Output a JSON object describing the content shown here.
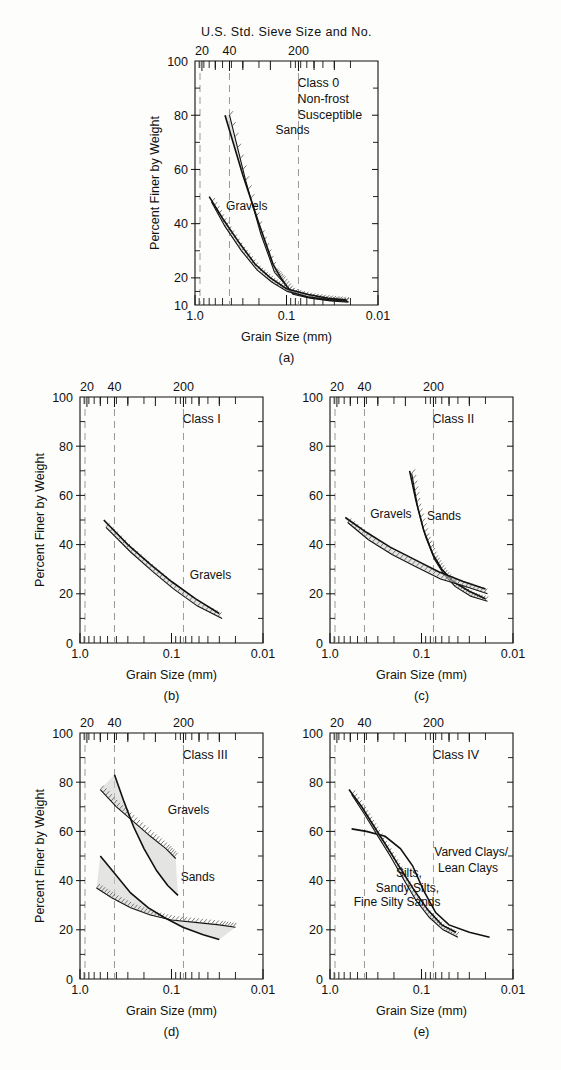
{
  "figure": {
    "sieve_axis_title": "U.S. Std. Sieve Size and No.",
    "sieve_ticks": [
      "20",
      "40",
      "200"
    ],
    "x_axis_label": "Grain Size (mm)",
    "x_ticks": [
      "1.0",
      "0.1",
      "0.01"
    ],
    "y_axis_label": "Percent Finer by Weight"
  },
  "panels": [
    {
      "caption": "(a)",
      "class_label": "Class 0",
      "class_sub_1": "Non-frost",
      "class_sub_2": "Susceptible",
      "y_ticks": [
        "100",
        "80",
        "60",
        "40",
        "20",
        "10"
      ],
      "y_min": 10,
      "y_max": 100,
      "curve_labels": [
        "Sands",
        "Gravels"
      ],
      "show_sieve_title": true,
      "show_ylabel": true
    },
    {
      "caption": "(b)",
      "class_label": "Class I",
      "y_ticks": [
        "100",
        "80",
        "60",
        "40",
        "20",
        "0"
      ],
      "y_min": 0,
      "y_max": 100,
      "curve_labels": [
        "Gravels"
      ],
      "show_sieve_title": false,
      "show_ylabel": true
    },
    {
      "caption": "(c)",
      "class_label": "Class II",
      "y_ticks": [
        "100",
        "80",
        "60",
        "40",
        "20",
        "0"
      ],
      "y_min": 0,
      "y_max": 100,
      "curve_labels": [
        "Gravels",
        "Sands"
      ],
      "show_sieve_title": false,
      "show_ylabel": false
    },
    {
      "caption": "(d)",
      "class_label": "Class III",
      "y_ticks": [
        "100",
        "80",
        "60",
        "40",
        "20",
        "0"
      ],
      "y_min": 0,
      "y_max": 100,
      "curve_labels": [
        "Gravels",
        "Sands"
      ],
      "show_sieve_title": false,
      "show_ylabel": true
    },
    {
      "caption": "(e)",
      "class_label": "Class IV",
      "y_ticks": [
        "100",
        "80",
        "60",
        "40",
        "20",
        "0"
      ],
      "y_min": 0,
      "y_max": 100,
      "curve_labels": [
        "Varved Clays/",
        "Lean Clays",
        "Silts,",
        "Sandy Silts,",
        "Fine Silty Sands"
      ],
      "show_sieve_title": false,
      "show_ylabel": false
    }
  ],
  "chart_data": {
    "type": "line",
    "xlabel": "Grain Size (mm)",
    "ylabel": "Percent Finer by Weight",
    "xscale": "log-reversed",
    "xlim": [
      1.0,
      0.01
    ],
    "x_tick_values": [
      1.0,
      0.1,
      0.01
    ],
    "secondary_axis": {
      "label": "U.S. Std. Sieve Size and No.",
      "tick_labels": [
        "20",
        "40",
        "200"
      ],
      "tick_grain_mm": [
        0.84,
        0.42,
        0.074
      ]
    },
    "grid": "vertical dashed at 1.0, 0.42 and 0.074 mm",
    "legend": "inline curve labels",
    "panels": [
      {
        "id": "a",
        "class": "Class 0",
        "subtitle": "Non-frost Susceptible",
        "ylim": [
          10,
          100
        ],
        "series": [
          {
            "name": "Sands",
            "band": true,
            "upper": [
              [
                0.47,
                80
              ],
              [
                0.3,
                58
              ],
              [
                0.2,
                40
              ],
              [
                0.14,
                25
              ],
              [
                0.115,
                20
              ],
              [
                0.09,
                15
              ],
              [
                0.06,
                13
              ],
              [
                0.035,
                12
              ],
              [
                0.022,
                11.5
              ]
            ],
            "lower": [
              [
                0.42,
                80
              ],
              [
                0.28,
                56
              ],
              [
                0.19,
                36
              ],
              [
                0.135,
                22
              ],
              [
                0.112,
                19
              ],
              [
                0.085,
                14
              ],
              [
                0.055,
                12.5
              ],
              [
                0.033,
                11.5
              ],
              [
                0.021,
                11
              ]
            ]
          },
          {
            "name": "Gravels",
            "band": true,
            "upper": [
              [
                0.7,
                50
              ],
              [
                0.5,
                42
              ],
              [
                0.33,
                33
              ],
              [
                0.22,
                25
              ],
              [
                0.15,
                20
              ],
              [
                0.1,
                16
              ],
              [
                0.06,
                14
              ],
              [
                0.035,
                12.5
              ],
              [
                0.022,
                11.8
              ]
            ],
            "lower": [
              [
                0.66,
                48
              ],
              [
                0.47,
                39
              ],
              [
                0.31,
                30
              ],
              [
                0.21,
                23
              ],
              [
                0.145,
                18.5
              ],
              [
                0.098,
                15
              ],
              [
                0.058,
                13
              ],
              [
                0.034,
                12
              ],
              [
                0.021,
                11.3
              ]
            ]
          }
        ]
      },
      {
        "id": "b",
        "class": "Class I",
        "ylim": [
          0,
          100
        ],
        "series": [
          {
            "name": "Gravels",
            "band": true,
            "upper": [
              [
                0.55,
                50
              ],
              [
                0.3,
                40
              ],
              [
                0.17,
                32
              ],
              [
                0.1,
                25
              ],
              [
                0.055,
                18
              ],
              [
                0.03,
                12
              ]
            ],
            "lower": [
              [
                0.52,
                47
              ],
              [
                0.28,
                37
              ],
              [
                0.16,
                29
              ],
              [
                0.095,
                22
              ],
              [
                0.052,
                15
              ],
              [
                0.028,
                10
              ]
            ]
          }
        ]
      },
      {
        "id": "c",
        "class": "Class II",
        "ylim": [
          0,
          100
        ],
        "series": [
          {
            "name": "Sands",
            "band": true,
            "upper": [
              [
                0.135,
                70
              ],
              [
                0.115,
                58
              ],
              [
                0.095,
                46
              ],
              [
                0.075,
                36
              ],
              [
                0.06,
                30
              ],
              [
                0.045,
                25
              ],
              [
                0.03,
                21
              ],
              [
                0.02,
                18
              ]
            ],
            "lower": [
              [
                0.128,
                69
              ],
              [
                0.11,
                55
              ],
              [
                0.09,
                43
              ],
              [
                0.072,
                34
              ],
              [
                0.057,
                28
              ],
              [
                0.043,
                23
              ],
              [
                0.029,
                19
              ],
              [
                0.019,
                17
              ]
            ]
          },
          {
            "name": "Gravels",
            "band": true,
            "upper": [
              [
                0.68,
                51
              ],
              [
                0.4,
                45
              ],
              [
                0.22,
                39
              ],
              [
                0.12,
                34
              ],
              [
                0.065,
                29
              ],
              [
                0.035,
                25
              ],
              [
                0.02,
                22
              ]
            ],
            "lower": [
              [
                0.64,
                49
              ],
              [
                0.38,
                42
              ],
              [
                0.21,
                36
              ],
              [
                0.115,
                31
              ],
              [
                0.062,
                26
              ],
              [
                0.033,
                23
              ],
              [
                0.019,
                20
              ]
            ]
          }
        ]
      },
      {
        "id": "d",
        "class": "Class III",
        "ylim": [
          0,
          100
        ],
        "series": [
          {
            "name": "Gravels-upper-pair",
            "band": true,
            "upper": [
              [
                0.42,
                83
              ],
              [
                0.33,
                72
              ],
              [
                0.26,
                62
              ],
              [
                0.2,
                53
              ],
              [
                0.145,
                44
              ],
              [
                0.11,
                38
              ],
              [
                0.085,
                34
              ]
            ],
            "lower": [
              [
                0.6,
                77
              ],
              [
                0.4,
                70
              ],
              [
                0.26,
                64
              ],
              [
                0.17,
                58
              ],
              [
                0.115,
                53
              ],
              [
                0.09,
                49
              ]
            ]
          },
          {
            "name": "Sands-lower-pair",
            "band": true,
            "upper": [
              [
                0.6,
                50
              ],
              [
                0.42,
                43
              ],
              [
                0.28,
                35
              ],
              [
                0.18,
                29
              ],
              [
                0.12,
                25
              ],
              [
                0.075,
                21
              ],
              [
                0.045,
                18
              ],
              [
                0.03,
                16
              ]
            ],
            "lower": [
              [
                0.66,
                37
              ],
              [
                0.45,
                33
              ],
              [
                0.28,
                29
              ],
              [
                0.17,
                26
              ],
              [
                0.1,
                24
              ],
              [
                0.055,
                23
              ],
              [
                0.03,
                22
              ],
              [
                0.02,
                21
              ]
            ]
          }
        ]
      },
      {
        "id": "e",
        "class": "Class IV",
        "ylim": [
          0,
          100
        ],
        "series": [
          {
            "name": "Varved Clays/Lean Clays",
            "band": false,
            "upper": [
              [
                0.58,
                61
              ],
              [
                0.4,
                60
              ],
              [
                0.25,
                58
              ],
              [
                0.17,
                53
              ],
              [
                0.125,
                46
              ],
              [
                0.095,
                36
              ],
              [
                0.07,
                27
              ],
              [
                0.05,
                22
              ],
              [
                0.03,
                19
              ],
              [
                0.018,
                17
              ]
            ]
          },
          {
            "name": "Silts, Sandy Silts, Fine Silty Sands",
            "band": true,
            "upper": [
              [
                0.62,
                77
              ],
              [
                0.45,
                70
              ],
              [
                0.33,
                62
              ],
              [
                0.24,
                54
              ],
              [
                0.17,
                45
              ],
              [
                0.12,
                36
              ],
              [
                0.085,
                28
              ],
              [
                0.06,
                22
              ],
              [
                0.042,
                19
              ]
            ],
            "lower": [
              [
                0.58,
                75
              ],
              [
                0.42,
                67
              ],
              [
                0.31,
                59
              ],
              [
                0.22,
                50
              ],
              [
                0.16,
                41
              ],
              [
                0.115,
                32
              ],
              [
                0.082,
                25
              ],
              [
                0.058,
                20
              ],
              [
                0.04,
                17
              ]
            ]
          }
        ]
      }
    ]
  }
}
